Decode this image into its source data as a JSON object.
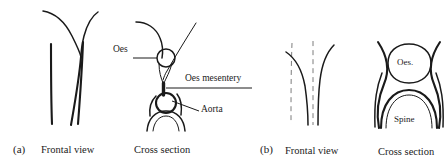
{
  "figure": {
    "ink_color": "#1a1a1a",
    "dash_color": "#7d7d7d",
    "background_color": "#ffffff"
  },
  "panel_a": {
    "tag": "(a)",
    "frontal_view_caption": "Frontal view",
    "cross_section_caption": "Cross section",
    "callouts": {
      "oes": "Oes",
      "oes_mesentery": "Oes mesentery",
      "aorta": "Aorta"
    }
  },
  "panel_b": {
    "tag": "(b)",
    "frontal_view_caption": "Frontal view",
    "cross_section_caption": "Cross section",
    "inner_labels": {
      "oes": "Oes.",
      "spine": "Spine"
    }
  }
}
